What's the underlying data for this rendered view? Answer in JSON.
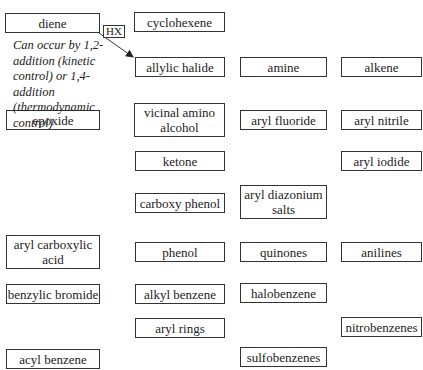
{
  "diagram": {
    "nodes": [
      {
        "id": "diene",
        "label": "diene",
        "x": 5,
        "y": 13,
        "w": 95,
        "h": 20
      },
      {
        "id": "cyclohexene",
        "label": "cyclohexene",
        "x": 134,
        "y": 12,
        "w": 91,
        "h": 20
      },
      {
        "id": "allylic-halide",
        "label": "allylic halide",
        "x": 135,
        "y": 57,
        "w": 90,
        "h": 20
      },
      {
        "id": "amine",
        "label": "amine",
        "x": 240,
        "y": 57,
        "w": 87,
        "h": 20
      },
      {
        "id": "alkene",
        "label": "alkene",
        "x": 341,
        "y": 57,
        "w": 81,
        "h": 20
      },
      {
        "id": "epoxide",
        "label": "epoxide",
        "x": 6,
        "y": 110,
        "w": 94,
        "h": 20
      },
      {
        "id": "vicinal-amino-alcohol",
        "label": "vicinal amino alcohol",
        "x": 134,
        "y": 103,
        "w": 91,
        "h": 34
      },
      {
        "id": "aryl-fluoride",
        "label": "aryl fluoride",
        "x": 240,
        "y": 110,
        "w": 87,
        "h": 20
      },
      {
        "id": "aryl-nitrile",
        "label": "aryl nitrile",
        "x": 341,
        "y": 110,
        "w": 81,
        "h": 20
      },
      {
        "id": "ketone",
        "label": "ketone",
        "x": 135,
        "y": 151,
        "w": 90,
        "h": 20
      },
      {
        "id": "aryl-iodide",
        "label": "aryl iodide",
        "x": 341,
        "y": 151,
        "w": 81,
        "h": 20
      },
      {
        "id": "carboxy-phenol",
        "label": "carboxy phenol",
        "x": 135,
        "y": 193,
        "w": 90,
        "h": 20
      },
      {
        "id": "aryl-diazonium-salts",
        "label": "aryl diazonium salts",
        "x": 240,
        "y": 185,
        "w": 87,
        "h": 34
      },
      {
        "id": "aryl-carboxylic-acid",
        "label": "aryl carboxylic acid",
        "x": 6,
        "y": 235,
        "w": 94,
        "h": 34
      },
      {
        "id": "phenol",
        "label": "phenol",
        "x": 135,
        "y": 242,
        "w": 90,
        "h": 20
      },
      {
        "id": "quinones",
        "label": "quinones",
        "x": 240,
        "y": 242,
        "w": 87,
        "h": 20
      },
      {
        "id": "anilines",
        "label": "anilines",
        "x": 341,
        "y": 242,
        "w": 81,
        "h": 20
      },
      {
        "id": "benzylic-bromide",
        "label": "benzylic bromide",
        "x": 6,
        "y": 284,
        "w": 94,
        "h": 20
      },
      {
        "id": "alkyl-benzene",
        "label": "alkyl benzene",
        "x": 135,
        "y": 284,
        "w": 90,
        "h": 20
      },
      {
        "id": "halobenzene",
        "label": "halobenzene",
        "x": 240,
        "y": 283,
        "w": 87,
        "h": 20
      },
      {
        "id": "aryl-rings",
        "label": "aryl rings",
        "x": 135,
        "y": 318,
        "w": 90,
        "h": 20
      },
      {
        "id": "nitrobenzenes",
        "label": "nitrobenzenes",
        "x": 341,
        "y": 317,
        "w": 81,
        "h": 20
      },
      {
        "id": "acyl-benzene",
        "label": "acyl benzene",
        "x": 6,
        "y": 349,
        "w": 94,
        "h": 20
      },
      {
        "id": "sulfobenzenes",
        "label": "sulfobenzenes",
        "x": 240,
        "y": 347,
        "w": 87,
        "h": 20
      }
    ],
    "edges": [
      {
        "from": "diene",
        "to": "allylic-halide",
        "reagent": "HX"
      }
    ],
    "reagent_label": "HX",
    "note": "Can occur by 1,2-addition (kinetic control) or 1,4-addition (thermodynamic control)"
  }
}
